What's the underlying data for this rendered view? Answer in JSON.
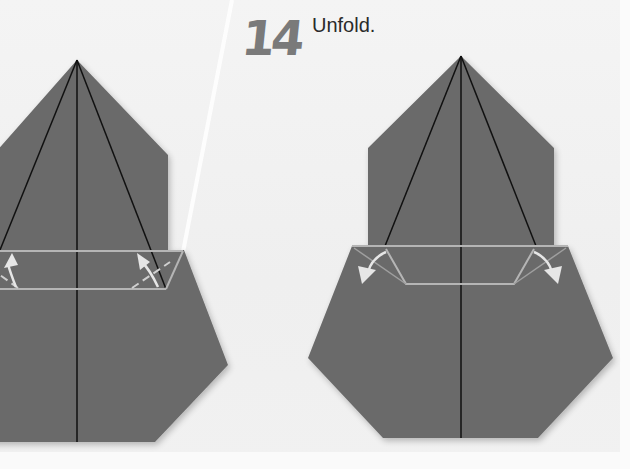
{
  "step": {
    "number": "14",
    "instruction": "Unfold."
  },
  "colors": {
    "paper": "#6b6b6b",
    "crease": "#111111",
    "fold_line": "#b5b5b5",
    "arrow": "#e6e6e6",
    "background": "#f2f2f2",
    "step_number": "#7a7a7a"
  },
  "figures": [
    {
      "id": "before",
      "description": "Model with band folded up; arrows indicate unfolding"
    },
    {
      "id": "after",
      "description": "Model with band unfolded; arrows point outward-down"
    }
  ]
}
